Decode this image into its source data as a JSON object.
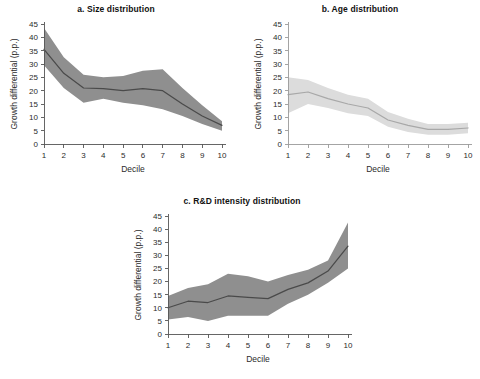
{
  "figure": {
    "background": "#ffffff",
    "width": 480,
    "height": 379
  },
  "panels": [
    {
      "id": "a",
      "title": "a. Size distribution",
      "shade": "dark",
      "band_color": "#8f8f8f",
      "line_color": "#4a4a4a",
      "axis_color": "#555555"
    },
    {
      "id": "b",
      "title": "b. Age distribution",
      "shade": "light",
      "band_color": "#dcdcdc",
      "line_color": "#a8a8a8",
      "axis_color": "#9a9a9a"
    },
    {
      "id": "c",
      "title": "c. R&D intensity distribution",
      "shade": "dark",
      "band_color": "#8f8f8f",
      "line_color": "#4a4a4a",
      "axis_color": "#555555"
    }
  ],
  "chart_data": [
    {
      "type": "line",
      "panel": "a",
      "title": "a. Size distribution",
      "xlabel": "Decile",
      "ylabel": "Growth differential (p.p.)",
      "x": [
        1,
        2,
        3,
        4,
        5,
        6,
        7,
        8,
        9,
        10
      ],
      "xticklabels": [
        "1",
        "2",
        "3",
        "4",
        "5",
        "6",
        "7",
        "8",
        "9",
        "10"
      ],
      "yticks": [
        0,
        5,
        10,
        15,
        20,
        25,
        30,
        35,
        40,
        45
      ],
      "yticklabels": [
        "0",
        "5",
        "10",
        "15",
        "20",
        "25",
        "30",
        "35",
        "40",
        "45"
      ],
      "xlim": [
        1,
        10
      ],
      "ylim": [
        0,
        45
      ],
      "grid": false,
      "legend": "none",
      "series": [
        {
          "name": "Point estimate",
          "values": [
            35.5,
            26.5,
            21.0,
            20.8,
            20.0,
            20.8,
            20.0,
            15.0,
            10.5,
            7.0
          ]
        },
        {
          "name": "Confidence band upper",
          "values": [
            43.5,
            32.5,
            26.0,
            25.0,
            25.5,
            27.5,
            28.0,
            21.0,
            14.5,
            8.5
          ]
        },
        {
          "name": "Confidence band lower",
          "values": [
            29.5,
            21.0,
            15.5,
            17.0,
            15.5,
            14.5,
            13.0,
            10.5,
            7.5,
            5.0
          ]
        }
      ]
    },
    {
      "type": "line",
      "panel": "b",
      "title": "b. Age distribution",
      "xlabel": "Decile",
      "ylabel": "Growth differential (p.p.)",
      "x": [
        1,
        2,
        3,
        4,
        5,
        6,
        7,
        8,
        9,
        10
      ],
      "xticklabels": [
        "1",
        "2",
        "3",
        "4",
        "5",
        "6",
        "7",
        "8",
        "9",
        "10"
      ],
      "yticks": [
        0,
        5,
        10,
        15,
        20,
        25,
        30,
        35,
        40,
        45
      ],
      "yticklabels": [
        "0",
        "5",
        "10",
        "15",
        "20",
        "25",
        "30",
        "35",
        "40",
        "45"
      ],
      "xlim": [
        1,
        10
      ],
      "ylim": [
        0,
        45
      ],
      "grid": false,
      "legend": "none",
      "series": [
        {
          "name": "Point estimate",
          "values": [
            18.5,
            19.5,
            17.0,
            15.0,
            13.5,
            9.0,
            7.0,
            5.5,
            5.5,
            6.0
          ]
        },
        {
          "name": "Confidence band upper",
          "values": [
            25.0,
            24.0,
            21.0,
            18.5,
            17.0,
            12.0,
            9.5,
            7.5,
            7.5,
            8.0
          ]
        },
        {
          "name": "Confidence band lower",
          "values": [
            11.5,
            15.0,
            13.5,
            11.5,
            10.5,
            6.5,
            4.5,
            3.5,
            3.5,
            4.0
          ]
        }
      ]
    },
    {
      "type": "line",
      "panel": "c",
      "title": "c. R&D intensity distribution",
      "xlabel": "Decile",
      "ylabel": "Growth differential (p.p.)",
      "x": [
        1,
        2,
        3,
        4,
        5,
        6,
        7,
        8,
        9,
        10
      ],
      "xticklabels": [
        "1",
        "2",
        "3",
        "4",
        "5",
        "6",
        "7",
        "8",
        "9",
        "10"
      ],
      "yticks": [
        0,
        5,
        10,
        15,
        20,
        25,
        30,
        35,
        40,
        45
      ],
      "yticklabels": [
        "0",
        "5",
        "10",
        "15",
        "20",
        "25",
        "30",
        "35",
        "40",
        "45"
      ],
      "xlim": [
        1,
        10
      ],
      "ylim": [
        0,
        45
      ],
      "grid": false,
      "legend": "none",
      "series": [
        {
          "name": "Point estimate",
          "values": [
            10.0,
            12.5,
            12.0,
            14.5,
            14.0,
            13.5,
            17.0,
            19.5,
            24.0,
            33.5
          ]
        },
        {
          "name": "Confidence band upper",
          "values": [
            14.5,
            17.5,
            19.0,
            23.0,
            22.0,
            20.0,
            22.5,
            24.5,
            28.0,
            42.5
          ]
        },
        {
          "name": "Confidence band lower",
          "values": [
            5.5,
            6.5,
            5.0,
            7.0,
            7.0,
            7.0,
            11.5,
            15.0,
            19.5,
            25.0
          ]
        }
      ]
    }
  ]
}
